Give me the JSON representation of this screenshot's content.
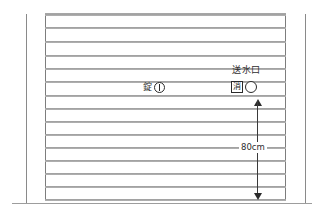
{
  "drawing": {
    "title": "shutter-elevation",
    "background_color": "#ffffff",
    "line_color": "#8f8f8f",
    "ink_color": "#2b2b2b"
  },
  "shutter": {
    "slat_count": 14,
    "slat_lines_y": [
      14,
      27,
      41,
      55,
      68,
      81,
      95,
      108,
      121,
      134,
      147,
      160,
      173,
      186,
      199
    ],
    "left_frame_x": 45,
    "right_frame_x": 285,
    "top_y": 13,
    "bottom_y": 200
  },
  "walls": {
    "left_wall_x": 26,
    "right_wall_x": 305,
    "top_y": 14,
    "ground_y": 203
  },
  "annotations": {
    "lock": {
      "label": "錠",
      "icon": "keyhole-circle-icon",
      "x": 143,
      "y": 82
    },
    "water_inlet": {
      "label": "送水口",
      "box_label": "消",
      "box_icon": "fire-hydrant-box-icon",
      "circle_icon": "inlet-circle-icon",
      "label_x": 232,
      "label_y": 66,
      "symbol_x": 231,
      "symbol_y": 81
    },
    "dimension": {
      "value": "80cm",
      "x": 257,
      "top_y": 99,
      "bottom_y": 200,
      "text_x": 238,
      "text_y": 143
    }
  }
}
